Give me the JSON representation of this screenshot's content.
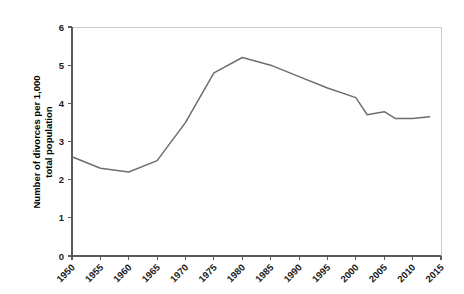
{
  "chart_data": {
    "type": "line",
    "title": "",
    "subtitle": "",
    "xlabel": "",
    "ylabel": "Number of divorces per 1,000 total population",
    "ylabel_line1": "Number of divorces per 1,000",
    "ylabel_line2": "total population",
    "xlim": [
      1950,
      2015
    ],
    "ylim": [
      0,
      6
    ],
    "grid": false,
    "legend": false,
    "legend_position": "none",
    "line_color": "#6e6e6e",
    "axis_color": "#5a5a5a",
    "border_color": "#c9c9c9",
    "background_color": "#ffffff",
    "x_tick_labels": [
      "1950",
      "1955",
      "1960",
      "1965",
      "1970",
      "1975",
      "1980",
      "1985",
      "1990",
      "1995",
      "2000",
      "2005",
      "2010",
      "2015"
    ],
    "y_tick_labels": [
      "0",
      "1",
      "2",
      "3",
      "4",
      "5",
      "6"
    ],
    "y_ticks": [
      0,
      1,
      2,
      3,
      4,
      5,
      6
    ],
    "x_ticks": [
      1950,
      1955,
      1960,
      1965,
      1970,
      1975,
      1980,
      1985,
      1990,
      1995,
      2000,
      2005,
      2010,
      2015
    ],
    "x": [
      1950,
      1955,
      1960,
      1965,
      1970,
      1975,
      1980,
      1985,
      1990,
      1995,
      2000,
      2002,
      2005,
      2007,
      2010,
      2013
    ],
    "values": [
      2.6,
      2.3,
      2.2,
      2.5,
      3.5,
      4.8,
      5.2,
      5.0,
      4.7,
      4.4,
      4.15,
      3.7,
      3.75,
      3.6,
      3.6,
      3.65
    ],
    "series": [
      {
        "name": "Divorce rate",
        "color": "#6e6e6e",
        "points": [
          {
            "x": 1950,
            "y": 2.6
          },
          {
            "x": 1955,
            "y": 2.3
          },
          {
            "x": 1960,
            "y": 2.2
          },
          {
            "x": 1965,
            "y": 2.5
          },
          {
            "x": 1970,
            "y": 3.5
          },
          {
            "x": 1975,
            "y": 4.8
          },
          {
            "x": 1980,
            "y": 5.2
          },
          {
            "x": 1985,
            "y": 5.0
          },
          {
            "x": 1990,
            "y": 4.7
          },
          {
            "x": 1995,
            "y": 4.4
          },
          {
            "x": 2000,
            "y": 4.15
          },
          {
            "x": 2002,
            "y": 3.7
          },
          {
            "x": 2005,
            "y": 3.78
          },
          {
            "x": 2007,
            "y": 3.6
          },
          {
            "x": 2010,
            "y": 3.6
          },
          {
            "x": 2013,
            "y": 3.65
          }
        ]
      }
    ]
  }
}
